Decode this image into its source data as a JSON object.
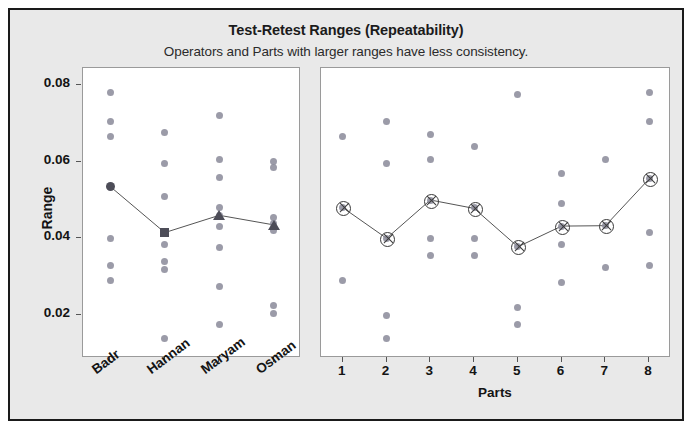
{
  "chart_data": {
    "type": "scatter",
    "title": "Test-Retest Ranges (Repeatability)",
    "subtitle": "Operators and Parts with larger ranges have less consistency.",
    "ylabel": "Range",
    "ylim": [
      0.012,
      0.081
    ],
    "yticks": [
      0.02,
      0.04,
      0.06,
      0.08
    ],
    "ytick_labels": [
      "0.02",
      "0.04",
      "0.06",
      "0.08"
    ],
    "grid": false,
    "legend": false,
    "colors": {
      "point": "#8d8d9c",
      "mean_marker": "#4d4d58",
      "mean_line": "#555555",
      "panel_background": "#ffffff",
      "figure_background": "#e9e9e9",
      "border": "#1a1a1a",
      "text": "#141414"
    },
    "panels": [
      {
        "name": "operators",
        "xlabel": "",
        "categories": [
          "Badr",
          "Hannan",
          "Maryam",
          "Osman"
        ],
        "mean_marker_shapes": [
          "circle-filled",
          "square",
          "triangle",
          "triangle"
        ],
        "means": [
          0.0535,
          0.0415,
          0.046,
          0.0435
        ],
        "values": [
          [
            0.078,
            0.0705,
            0.0665,
            0.0535,
            0.04,
            0.033,
            0.029
          ],
          [
            0.0675,
            0.0595,
            0.051,
            0.0415,
            0.0385,
            0.034,
            0.032,
            0.014
          ],
          [
            0.072,
            0.0605,
            0.056,
            0.048,
            0.046,
            0.043,
            0.0375,
            0.0275,
            0.0175
          ],
          [
            0.06,
            0.0585,
            0.0455,
            0.044,
            0.042,
            0.0225,
            0.0205
          ]
        ]
      },
      {
        "name": "parts",
        "xlabel": "Parts",
        "categories": [
          "1",
          "2",
          "3",
          "4",
          "5",
          "6",
          "7",
          "8"
        ],
        "mean_marker_shapes": [
          "circle-x",
          "circle-x",
          "circle-x",
          "circle-x",
          "circle-x",
          "circle-x",
          "circle-x",
          "circle-x"
        ],
        "means": [
          0.048,
          0.04,
          0.05,
          0.0478,
          0.0378,
          0.0432,
          0.0433,
          0.0555
        ],
        "values": [
          [
            0.0665,
            0.048,
            0.029
          ],
          [
            0.0705,
            0.0595,
            0.04,
            0.02,
            0.014
          ],
          [
            0.067,
            0.0605,
            0.05,
            0.04,
            0.0355
          ],
          [
            0.064,
            0.048,
            0.04,
            0.0355
          ],
          [
            0.0775,
            0.0378,
            0.022,
            0.0175
          ],
          [
            0.057,
            0.049,
            0.0432,
            0.0385,
            0.0285
          ],
          [
            0.0605,
            0.0433,
            0.0325
          ],
          [
            0.078,
            0.0705,
            0.0555,
            0.0415,
            0.033
          ]
        ]
      }
    ]
  }
}
